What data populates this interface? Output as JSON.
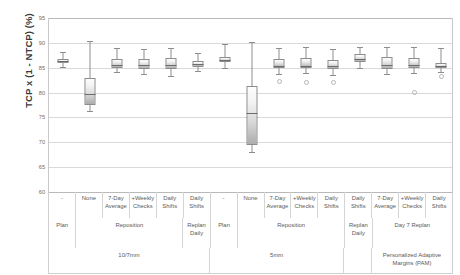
{
  "chart_data": {
    "type": "box",
    "title": "",
    "xlabel": "",
    "ylabel": "TCP x (1 - NTCP)  (%)",
    "ylim": [
      60,
      95
    ],
    "yticks": [
      95,
      90,
      85,
      80,
      75,
      70,
      65,
      60
    ],
    "grid": true,
    "legend": "none",
    "categories": [
      "-",
      "None",
      "7-Day Average",
      "+Weekly Checks",
      "Daily Shifts",
      "Daily Shifts",
      "-",
      "None",
      "7-Day Average",
      "+Weekly Checks",
      "Daily Shifts",
      "Daily Shifts",
      "7-Day Average",
      "+Weekly Checks",
      "Daily Shifts"
    ],
    "boxes": [
      {
        "label": "Plan 10/7mm",
        "min": 85.2,
        "q1": 86.0,
        "median": 86.3,
        "q3": 86.7,
        "max": 88.2,
        "outliers": []
      },
      {
        "label": "Reposition None 10/7mm",
        "min": 76.3,
        "q1": 77.6,
        "median": 79.7,
        "q3": 83.0,
        "max": 90.3,
        "outliers": []
      },
      {
        "label": "Reposition 7-Day Avg 10/7mm",
        "min": 84.2,
        "q1": 84.9,
        "median": 85.6,
        "q3": 86.8,
        "max": 88.9,
        "outliers": []
      },
      {
        "label": "Reposition +Weekly 10/7mm",
        "min": 83.7,
        "q1": 84.8,
        "median": 85.5,
        "q3": 86.8,
        "max": 88.8,
        "outliers": []
      },
      {
        "label": "Reposition Daily Shifts 10/7mm",
        "min": 83.3,
        "q1": 84.7,
        "median": 85.6,
        "q3": 86.9,
        "max": 89.0,
        "outliers": []
      },
      {
        "label": "Replan Daily 10/7mm",
        "min": 84.3,
        "q1": 85.2,
        "median": 85.7,
        "q3": 86.4,
        "max": 87.9,
        "outliers": []
      },
      {
        "label": "Plan 5mm",
        "min": 85.0,
        "q1": 86.1,
        "median": 86.6,
        "q3": 87.1,
        "max": 89.8,
        "outliers": []
      },
      {
        "label": "Reposition None 5mm",
        "min": 68.0,
        "q1": 69.4,
        "median": 75.9,
        "q3": 81.3,
        "max": 90.1,
        "outliers": []
      },
      {
        "label": "Reposition 7-Day Avg 5mm",
        "min": 83.8,
        "q1": 84.9,
        "median": 85.3,
        "q3": 86.7,
        "max": 89.0,
        "outliers": [
          82.4
        ]
      },
      {
        "label": "Reposition +Weekly 5mm",
        "min": 83.9,
        "q1": 84.9,
        "median": 85.3,
        "q3": 86.9,
        "max": 89.2,
        "outliers": [
          82.3
        ]
      },
      {
        "label": "Reposition Daily Shifts 5mm",
        "min": 83.6,
        "q1": 84.8,
        "median": 85.4,
        "q3": 86.5,
        "max": 88.8,
        "outliers": [
          82.3
        ]
      },
      {
        "label": "Replan Daily 5mm",
        "min": 85.0,
        "q1": 86.1,
        "median": 86.8,
        "q3": 87.7,
        "max": 89.1,
        "outliers": []
      },
      {
        "label": "Day 7 Replan 7-Day Avg PAM",
        "min": 83.8,
        "q1": 84.8,
        "median": 85.5,
        "q3": 87.1,
        "max": 89.1,
        "outliers": []
      },
      {
        "label": "Day 7 Replan +Weekly PAM",
        "min": 83.9,
        "q1": 84.9,
        "median": 85.6,
        "q3": 87.0,
        "max": 89.2,
        "outliers": [
          80.2
        ]
      },
      {
        "label": "Day 7 Replan Daily Shifts PAM",
        "min": 84.2,
        "q1": 85.0,
        "median": 85.4,
        "q3": 86.0,
        "max": 88.9,
        "outliers": [
          83.4
        ]
      }
    ]
  },
  "axis": {
    "ylabel": "TCP x (1 - NTCP)  (%)",
    "ticks": [
      "95",
      "90",
      "85",
      "80",
      "75",
      "70",
      "65",
      "60"
    ]
  },
  "table": {
    "labels": [
      "-",
      "None",
      "7-Day\nAverage",
      "+Weekly\nChecks",
      "Daily\nShifts",
      "Daily\nShifts",
      "-",
      "None",
      "7-Day\nAverage",
      "+Weekly\nChecks",
      "Daily\nShifts",
      "Daily\nShifts",
      "7-Day\nAverage",
      "+Weekly\nChecks",
      "Daily\nShifts"
    ],
    "groups": [
      {
        "label": "Plan",
        "span": 1
      },
      {
        "label": "Reposition",
        "span": 4
      },
      {
        "label": "Replan\nDaily",
        "span": 1
      },
      {
        "label": "Plan",
        "span": 1
      },
      {
        "label": "Reposition",
        "span": 4
      },
      {
        "label": "Replan\nDaily",
        "span": 1
      },
      {
        "label": "Day 7 Replan",
        "span": 3
      }
    ],
    "margins": [
      {
        "label": "10/7mm",
        "span": 6
      },
      {
        "label": "5mm",
        "span": 5
      },
      {
        "label": "",
        "span": 1
      },
      {
        "label": "Personalized Adaptive\nMargins (PAM)",
        "span": 3
      }
    ]
  }
}
